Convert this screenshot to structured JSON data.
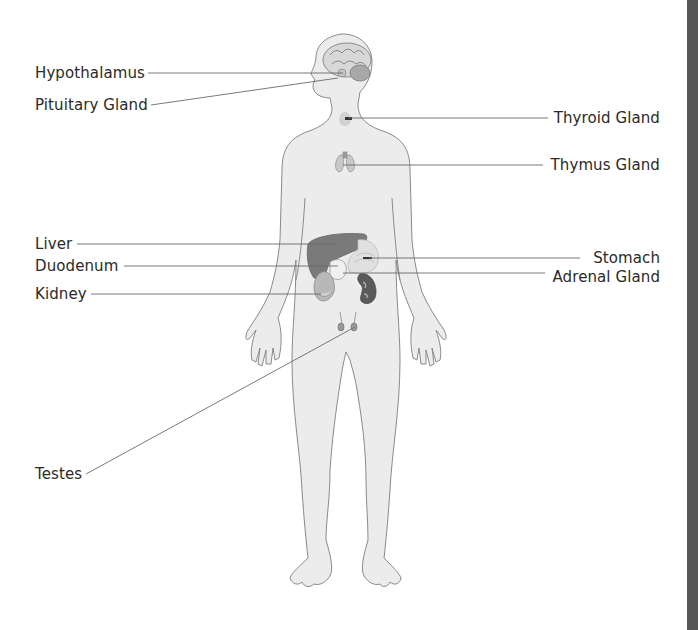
{
  "diagram": {
    "colors": {
      "background": "#ffffff",
      "body_fill": "#ececec",
      "body_outline": "#8a8a8a",
      "leader_line": "#6a6a6a",
      "label_text": "#2a2a2a",
      "organ_dark": "#6e6e6e",
      "organ_mid": "#a5a5a5",
      "organ_light": "#d9d9d9",
      "scrollbar": "#585858"
    },
    "labels_left": [
      {
        "id": "hypothalamus",
        "text": "Hypothalamus"
      },
      {
        "id": "pituitary",
        "text": "Pituitary Gland"
      },
      {
        "id": "liver",
        "text": "Liver"
      },
      {
        "id": "duodenum",
        "text": "Duodenum"
      },
      {
        "id": "kidney",
        "text": "Kidney"
      },
      {
        "id": "testes",
        "text": "Testes"
      }
    ],
    "labels_right": [
      {
        "id": "thyroid",
        "text": "Thyroid Gland"
      },
      {
        "id": "thymus",
        "text": "Thymus Gland"
      },
      {
        "id": "stomach",
        "text": "Stomach"
      },
      {
        "id": "adrenal",
        "text": "Adrenal Gland"
      }
    ]
  }
}
